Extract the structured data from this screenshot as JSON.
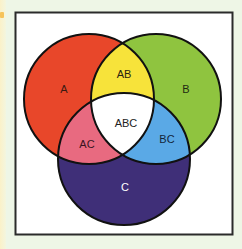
{
  "diagram": {
    "type": "venn",
    "sets": [
      "A",
      "B",
      "C"
    ],
    "regions": [
      {
        "id": "A",
        "label": "A",
        "color": "#e8472a",
        "text_color": "#3a1a12"
      },
      {
        "id": "B",
        "label": "B",
        "color": "#8fc43f",
        "text_color": "#1f2a12"
      },
      {
        "id": "C",
        "label": "C",
        "color": "#3f2f78",
        "text_color": "#ffffff"
      },
      {
        "id": "AB",
        "label": "AB",
        "color": "#f7e33a",
        "text_color": "#2a2410"
      },
      {
        "id": "AC",
        "label": "AC",
        "color": "#e86a80",
        "text_color": "#3a1420"
      },
      {
        "id": "BC",
        "label": "BC",
        "color": "#5aa9e6",
        "text_color": "#14263a"
      },
      {
        "id": "ABC",
        "label": "ABC",
        "color": "#ffffff",
        "text_color": "#222222"
      }
    ],
    "labels": {
      "a": "A",
      "b": "B",
      "c": "C",
      "ab": "AB",
      "ac": "AC",
      "bc": "BC",
      "abc": "ABC"
    },
    "colors": {
      "background": "#eef6e6",
      "frame_fill": "#ffffff",
      "frame_border": "#2b2b2b",
      "outline": "#111111"
    }
  }
}
